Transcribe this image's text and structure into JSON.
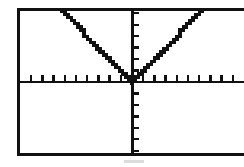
{
  "screen": {
    "device": "graphing-calculator",
    "background_color": "#ffffff",
    "ink_color": "#111111",
    "frame_color": "#111111",
    "artifact_color": "#dcdcdc"
  },
  "chart_data": {
    "type": "line",
    "title": "",
    "subtitle": "",
    "xlabel": "",
    "ylabel": "",
    "equation": "y = |x|",
    "grid": false,
    "legend": null,
    "legend_position": "none",
    "axis_style": "crosshair-with-ticks",
    "xlim": [
      -10,
      10
    ],
    "ylim": [
      -6.2,
      6.2
    ],
    "x_tick_interval": 1,
    "y_tick_interval": 1,
    "x_tick_count_left": 10,
    "x_tick_count_right": 10,
    "y_tick_count_above": 6,
    "y_tick_count_below": 6,
    "x_tick_labels": [],
    "y_tick_labels": [],
    "annotations": [],
    "series": [
      {
        "name": "y = |x|",
        "color": "#111111",
        "style": "pixelated",
        "x": [
          -10,
          -9,
          -8,
          -7,
          -6,
          -5,
          -4,
          -3,
          -2,
          -1,
          0,
          1,
          2,
          3,
          4,
          5,
          6,
          7,
          8,
          9,
          10
        ],
        "values": [
          10,
          9,
          8,
          7,
          6,
          5,
          4,
          3,
          2,
          1,
          0,
          1,
          2,
          3,
          4,
          5,
          6,
          7,
          8,
          9,
          10
        ],
        "vertex": [
          0,
          0
        ],
        "left_branch_slope": -1,
        "right_branch_slope": 1
      }
    ]
  }
}
